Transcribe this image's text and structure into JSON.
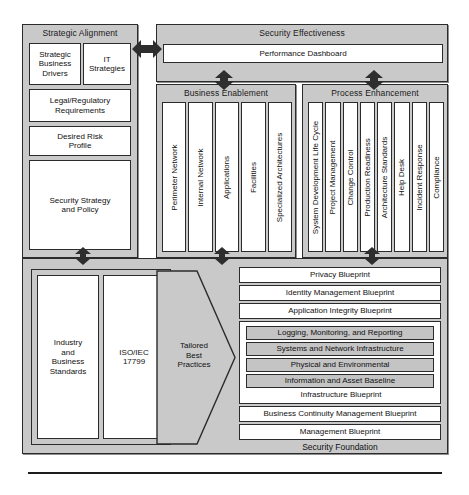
{
  "diagram": {
    "colors": {
      "panel_fill": "#c9c9c9",
      "box_fill": "#ffffff",
      "shaded_fill": "#c4c4c4",
      "stroke": "#2b2b2b",
      "arrow": "#2e2e2e"
    }
  },
  "strategic_alignment": {
    "title": "Strategic Alignment",
    "items": [
      {
        "label": "Strategic\nBusiness\nDrivers"
      },
      {
        "label": "IT\nStrategies"
      },
      {
        "label": "Legal/Regulatory\nRequirements"
      },
      {
        "label": "Desired Risk\nProfile"
      },
      {
        "label": "Security Strategy\nand Policy"
      }
    ]
  },
  "security_effectiveness": {
    "title": "Security Effectiveness",
    "dashboard_label": "Performance Dashboard"
  },
  "business_enablement": {
    "title": "Business Enablement",
    "items": [
      "Perimeter Network",
      "Internal Network",
      "Applications",
      "Facilities",
      "Specialized Architectures"
    ]
  },
  "process_enhancement": {
    "title": "Process Enhancement",
    "items": [
      "System Development Life Cycle",
      "Project Management",
      "Change Control",
      "Production Readiness",
      "Architecture Standards",
      "Help Desk",
      "Incident Response",
      "Compliance"
    ]
  },
  "standards": {
    "industry_label": "Industry\nand\nBusiness\nStandards",
    "iso_label": "ISO/IEC\n17799",
    "tailored_label": "Tailored\nBest\nPractices"
  },
  "blueprints": {
    "top_items": [
      "Privacy Blueprint",
      "Identity Management Blueprint",
      "Application Integrity Blueprint"
    ],
    "infrastructure": {
      "children": [
        "Logging, Monitoring, and Reporting",
        "Systems and Network Infrastructure",
        "Physical and Environmental",
        "Information and Asset Baseline"
      ],
      "label": "Infrastructure Blueprint"
    },
    "bottom_items": [
      "Business Continuity Management Blueprint",
      "Management Blueprint"
    ],
    "foundation_label": "Security Foundation"
  }
}
